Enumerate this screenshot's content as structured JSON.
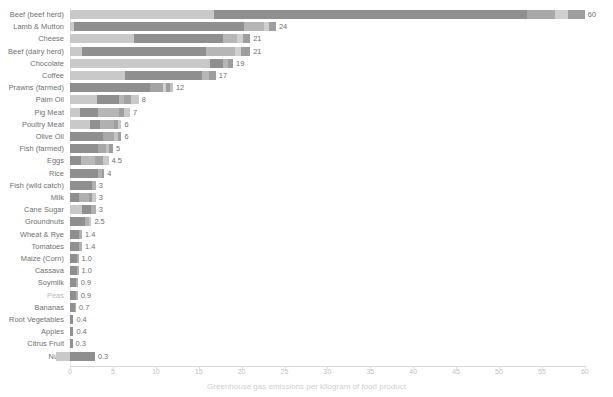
{
  "chart_data": {
    "type": "bar",
    "title": "",
    "subtitle": "",
    "xlabel": "Greenhouse gas emissions per kilogram of food product",
    "ylabel": "",
    "orientation": "horizontal",
    "stacked": true,
    "grid": false,
    "legend": "none",
    "xlim": [
      -2,
      62
    ],
    "xticks": [
      0,
      5,
      10,
      15,
      20,
      25,
      30,
      35,
      40,
      45,
      50,
      55,
      60
    ],
    "categories": [
      "Beef (beef herd)",
      "Lamb & Mutton",
      "Cheese",
      "Beef (dairy herd)",
      "Chocolate",
      "Coffee",
      "Prawns (farmed)",
      "Palm Oil",
      "Pig Meat",
      "Poultry Meat",
      "Olive Oil",
      "Fish (farmed)",
      "Eggs",
      "Rice",
      "Fish (wild catch)",
      "Milk",
      "Cane Sugar",
      "Groundnuts",
      "Wheat & Rye",
      "Tomatoes",
      "Maize (Corn)",
      "Cassava",
      "Soymilk",
      "Peas",
      "Bananas",
      "Root Vegetables",
      "Apples",
      "Citrus Fruit",
      "Nuts"
    ],
    "values": [
      60,
      24,
      21,
      21,
      19,
      17,
      12,
      8,
      7,
      6,
      6,
      5,
      4.5,
      4,
      3,
      3,
      3,
      2.5,
      1.4,
      1.4,
      1.0,
      1.0,
      0.9,
      0.9,
      0.7,
      0.4,
      0.4,
      0.3,
      0.3
    ],
    "value_labels": [
      "60",
      "24",
      "21",
      "21",
      "19",
      "17",
      "12",
      "8",
      "7",
      "6",
      "6",
      "5",
      "4.5",
      "4",
      "3",
      "3",
      "3",
      "2.5",
      "1.4",
      "1.4",
      "1.0",
      "1.0",
      "0.9",
      "0.9",
      "0.7",
      "0.4",
      "0.4",
      "0.3",
      "0.3"
    ],
    "faint_categories": [
      "Peas"
    ],
    "segment_colors": [
      "#c9c9c9",
      "#8f8f8f",
      "#a8a8a8",
      "#bdbdbd",
      "#9c9c9c",
      "#d2d2d2"
    ],
    "rows": [
      {
        "category": "Beef (beef herd)",
        "total": 60,
        "label": "60",
        "segments": [
          {
            "start": 0,
            "width": 16.8,
            "color": "#c9c9c9"
          },
          {
            "start": 16.8,
            "width": 36.5,
            "color": "#8f8f8f"
          },
          {
            "start": 53.3,
            "width": 3.2,
            "color": "#a9a9a9"
          },
          {
            "start": 56.5,
            "width": 1.5,
            "color": "#cfcfcf"
          },
          {
            "start": 58.0,
            "width": 2.0,
            "color": "#9e9e9e"
          }
        ]
      },
      {
        "category": "Lamb & Mutton",
        "total": 24,
        "label": "24",
        "segments": [
          {
            "start": 0,
            "width": 0.5,
            "color": "#c9c9c9"
          },
          {
            "start": 0.5,
            "width": 19.8,
            "color": "#8f8f8f"
          },
          {
            "start": 20.3,
            "width": 2.3,
            "color": "#b6b6b6"
          },
          {
            "start": 22.6,
            "width": 0.6,
            "color": "#d0d0d0"
          },
          {
            "start": 23.2,
            "width": 0.8,
            "color": "#9e9e9e"
          }
        ]
      },
      {
        "category": "Cheese",
        "total": 21,
        "label": "21",
        "segments": [
          {
            "start": 0,
            "width": 7.5,
            "color": "#c9c9c9"
          },
          {
            "start": 7.5,
            "width": 10.3,
            "color": "#8f8f8f"
          },
          {
            "start": 17.8,
            "width": 1.7,
            "color": "#b6b6b6"
          },
          {
            "start": 19.5,
            "width": 0.7,
            "color": "#d0d0d0"
          },
          {
            "start": 20.2,
            "width": 0.8,
            "color": "#9e9e9e"
          }
        ]
      },
      {
        "category": "Beef (dairy herd)",
        "total": 21,
        "label": "21",
        "segments": [
          {
            "start": 0,
            "width": 1.4,
            "color": "#c9c9c9"
          },
          {
            "start": 1.4,
            "width": 14.5,
            "color": "#8f8f8f"
          },
          {
            "start": 15.9,
            "width": 3.3,
            "color": "#b6b6b6"
          },
          {
            "start": 19.2,
            "width": 0.7,
            "color": "#d0d0d0"
          },
          {
            "start": 19.9,
            "width": 1.1,
            "color": "#9e9e9e"
          }
        ]
      },
      {
        "category": "Chocolate",
        "total": 19,
        "label": "19",
        "segments": [
          {
            "start": 0,
            "width": 16.3,
            "color": "#c9c9c9"
          },
          {
            "start": 16.3,
            "width": 1.5,
            "color": "#8f8f8f"
          },
          {
            "start": 17.8,
            "width": 0.6,
            "color": "#b6b6b6"
          },
          {
            "start": 18.4,
            "width": 0.6,
            "color": "#9e9e9e"
          }
        ]
      },
      {
        "category": "Coffee",
        "total": 17,
        "label": "17",
        "segments": [
          {
            "start": 0,
            "width": 6.4,
            "color": "#c9c9c9"
          },
          {
            "start": 6.4,
            "width": 9.0,
            "color": "#8f8f8f"
          },
          {
            "start": 15.4,
            "width": 0.8,
            "color": "#b6b6b6"
          },
          {
            "start": 16.2,
            "width": 0.8,
            "color": "#9e9e9e"
          }
        ]
      },
      {
        "category": "Prawns (farmed)",
        "total": 12,
        "label": "12",
        "segments": [
          {
            "start": 0,
            "width": 9.3,
            "color": "#8f8f8f"
          },
          {
            "start": 9.3,
            "width": 1.5,
            "color": "#a3a3a3"
          },
          {
            "start": 10.8,
            "width": 0.4,
            "color": "#d0d0d0"
          },
          {
            "start": 11.2,
            "width": 0.5,
            "color": "#9e9e9e"
          },
          {
            "start": 11.7,
            "width": 0.3,
            "color": "#c2c2c2"
          }
        ]
      },
      {
        "category": "Palm Oil",
        "total": 8,
        "label": "8",
        "segments": [
          {
            "start": 0,
            "width": 3.1,
            "color": "#c9c9c9"
          },
          {
            "start": 3.1,
            "width": 2.6,
            "color": "#8f8f8f"
          },
          {
            "start": 5.7,
            "width": 0.6,
            "color": "#b6b6b6"
          },
          {
            "start": 6.3,
            "width": 0.8,
            "color": "#a3a3a3"
          },
          {
            "start": 7.1,
            "width": 0.9,
            "color": "#c9c9c9"
          }
        ]
      },
      {
        "category": "Pig Meat",
        "total": 7,
        "label": "7",
        "segments": [
          {
            "start": 0,
            "width": 1.2,
            "color": "#c9c9c9"
          },
          {
            "start": 1.2,
            "width": 2.1,
            "color": "#8f8f8f"
          },
          {
            "start": 3.3,
            "width": 2.4,
            "color": "#b6b6b6"
          },
          {
            "start": 5.7,
            "width": 0.6,
            "color": "#9e9e9e"
          },
          {
            "start": 6.3,
            "width": 0.7,
            "color": "#c9c9c9"
          }
        ]
      },
      {
        "category": "Poultry Meat",
        "total": 6,
        "label": "6",
        "segments": [
          {
            "start": 0,
            "width": 2.3,
            "color": "#c9c9c9"
          },
          {
            "start": 2.3,
            "width": 1.2,
            "color": "#8f8f8f"
          },
          {
            "start": 3.5,
            "width": 1.6,
            "color": "#b0b0b0"
          },
          {
            "start": 5.1,
            "width": 0.5,
            "color": "#9e9e9e"
          },
          {
            "start": 5.6,
            "width": 0.4,
            "color": "#c9c9c9"
          }
        ]
      },
      {
        "category": "Olive Oil",
        "total": 6,
        "label": "6",
        "segments": [
          {
            "start": 0,
            "width": 3.8,
            "color": "#8f8f8f"
          },
          {
            "start": 3.8,
            "width": 1.3,
            "color": "#a8a8a8"
          },
          {
            "start": 5.1,
            "width": 0.5,
            "color": "#c4c4c4"
          },
          {
            "start": 5.6,
            "width": 0.4,
            "color": "#9e9e9e"
          }
        ]
      },
      {
        "category": "Fish (farmed)",
        "total": 5,
        "label": "5",
        "segments": [
          {
            "start": 0,
            "width": 3.3,
            "color": "#8f8f8f"
          },
          {
            "start": 3.3,
            "width": 0.9,
            "color": "#a8a8a8"
          },
          {
            "start": 4.2,
            "width": 0.4,
            "color": "#c4c4c4"
          },
          {
            "start": 4.6,
            "width": 0.4,
            "color": "#9e9e9e"
          }
        ]
      },
      {
        "category": "Eggs",
        "total": 4.5,
        "label": "4.5",
        "segments": [
          {
            "start": 0,
            "width": 1.3,
            "color": "#8f8f8f"
          },
          {
            "start": 1.3,
            "width": 1.6,
            "color": "#b8b8b8"
          },
          {
            "start": 2.9,
            "width": 0.9,
            "color": "#a3a3a3"
          },
          {
            "start": 3.8,
            "width": 0.7,
            "color": "#c9c9c9"
          }
        ]
      },
      {
        "category": "Rice",
        "total": 4,
        "label": "4",
        "segments": [
          {
            "start": 0,
            "width": 3.3,
            "color": "#8f8f8f"
          },
          {
            "start": 3.3,
            "width": 0.4,
            "color": "#b0b0b0"
          },
          {
            "start": 3.7,
            "width": 0.3,
            "color": "#9e9e9e"
          }
        ]
      },
      {
        "category": "Fish (wild catch)",
        "total": 3,
        "label": "3",
        "segments": [
          {
            "start": 0,
            "width": 2.6,
            "color": "#8f8f8f"
          },
          {
            "start": 2.6,
            "width": 0.4,
            "color": "#b0b0b0"
          }
        ]
      },
      {
        "category": "Milk",
        "total": 3,
        "label": "3",
        "segments": [
          {
            "start": 0,
            "width": 1.0,
            "color": "#8f8f8f"
          },
          {
            "start": 1.0,
            "width": 1.2,
            "color": "#b0b0b0"
          },
          {
            "start": 2.2,
            "width": 0.4,
            "color": "#9e9e9e"
          },
          {
            "start": 2.6,
            "width": 0.4,
            "color": "#c9c9c9"
          }
        ]
      },
      {
        "category": "Cane Sugar",
        "total": 3,
        "label": "3",
        "segments": [
          {
            "start": 0,
            "width": 1.4,
            "color": "#c9c9c9"
          },
          {
            "start": 1.4,
            "width": 1.0,
            "color": "#8f8f8f"
          },
          {
            "start": 2.4,
            "width": 0.6,
            "color": "#b0b0b0"
          }
        ]
      },
      {
        "category": "Groundnuts",
        "total": 2.5,
        "label": "2.5",
        "segments": [
          {
            "start": 0,
            "width": 1.7,
            "color": "#8f8f8f"
          },
          {
            "start": 1.7,
            "width": 0.5,
            "color": "#b0b0b0"
          },
          {
            "start": 2.2,
            "width": 0.3,
            "color": "#c9c9c9"
          }
        ]
      },
      {
        "category": "Wheat & Rye",
        "total": 1.4,
        "label": "1.4",
        "segments": [
          {
            "start": 0,
            "width": 1.1,
            "color": "#8f8f8f"
          },
          {
            "start": 1.1,
            "width": 0.3,
            "color": "#b0b0b0"
          }
        ]
      },
      {
        "category": "Tomatoes",
        "total": 1.4,
        "label": "1.4",
        "segments": [
          {
            "start": 0,
            "width": 1.0,
            "color": "#8f8f8f"
          },
          {
            "start": 1.0,
            "width": 0.4,
            "color": "#b0b0b0"
          }
        ]
      },
      {
        "category": "Maize (Corn)",
        "total": 1.0,
        "label": "1.0",
        "segments": [
          {
            "start": 0,
            "width": 0.8,
            "color": "#8f8f8f"
          },
          {
            "start": 0.8,
            "width": 0.2,
            "color": "#b0b0b0"
          }
        ]
      },
      {
        "category": "Cassava",
        "total": 1.0,
        "label": "1.0",
        "segments": [
          {
            "start": 0,
            "width": 0.8,
            "color": "#8f8f8f"
          },
          {
            "start": 0.8,
            "width": 0.2,
            "color": "#b0b0b0"
          }
        ]
      },
      {
        "category": "Soymilk",
        "total": 0.9,
        "label": "0.9",
        "segments": [
          {
            "start": 0,
            "width": 0.7,
            "color": "#8f8f8f"
          },
          {
            "start": 0.7,
            "width": 0.2,
            "color": "#b0b0b0"
          }
        ]
      },
      {
        "category": "Peas",
        "total": 0.9,
        "label": "0.9",
        "segments": [
          {
            "start": 0,
            "width": 0.7,
            "color": "#8f8f8f"
          },
          {
            "start": 0.7,
            "width": 0.2,
            "color": "#b0b0b0"
          }
        ]
      },
      {
        "category": "Bananas",
        "total": 0.7,
        "label": "0.7",
        "segments": [
          {
            "start": 0,
            "width": 0.6,
            "color": "#8f8f8f"
          },
          {
            "start": 0.6,
            "width": 0.1,
            "color": "#b0b0b0"
          }
        ]
      },
      {
        "category": "Root Vegetables",
        "total": 0.4,
        "label": "0.4",
        "segments": [
          {
            "start": 0,
            "width": 0.4,
            "color": "#8f8f8f"
          }
        ]
      },
      {
        "category": "Apples",
        "total": 0.4,
        "label": "0.4",
        "segments": [
          {
            "start": 0,
            "width": 0.4,
            "color": "#8f8f8f"
          }
        ]
      },
      {
        "category": "Citrus Fruit",
        "total": 0.3,
        "label": "0.3",
        "segments": [
          {
            "start": 0,
            "width": 0.3,
            "color": "#8f8f8f"
          }
        ]
      },
      {
        "category": "Nuts",
        "total": 0.3,
        "label": "0.3",
        "segments": [
          {
            "start": -1.6,
            "width": 1.6,
            "color": "#c9c9c9"
          },
          {
            "start": 0,
            "width": 2.9,
            "color": "#8f8f8f"
          }
        ]
      }
    ]
  }
}
